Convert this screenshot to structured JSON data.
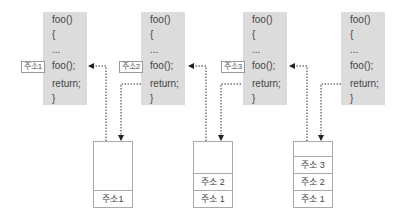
{
  "code_blocks": [
    {
      "lines": [
        "foo()",
        "{",
        "...",
        "foo();",
        "return;",
        "}"
      ],
      "call_label": "주소1"
    },
    {
      "lines": [
        "foo()",
        "{",
        "...",
        "foo();",
        "return;",
        "}"
      ],
      "call_label": "주소2"
    },
    {
      "lines": [
        "foo()",
        "{",
        "...",
        "foo();",
        "return;",
        "}"
      ],
      "call_label": "주소3"
    },
    {
      "lines": [
        "foo()",
        "{",
        "...",
        "foo();",
        "return;",
        "}"
      ]
    }
  ],
  "stacks": [
    {
      "cells": [
        "주소1"
      ]
    },
    {
      "cells": [
        "주소 2",
        "주소 1"
      ]
    },
    {
      "cells": [
        "주소 3",
        "주소 2",
        "주소 1"
      ]
    }
  ],
  "colors": {
    "code_bg": "#dcdcdc",
    "line": "#333333",
    "border": "#aaaaaa"
  }
}
